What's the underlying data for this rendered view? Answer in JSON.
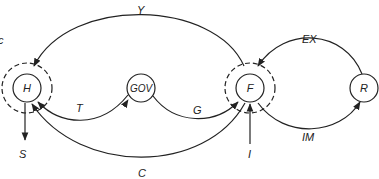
{
  "diagram": {
    "corner_label": "c",
    "nodes": [
      {
        "id": "H",
        "label": "H",
        "boundary": "dashed"
      },
      {
        "id": "GOV",
        "label": "GOV",
        "boundary": "none"
      },
      {
        "id": "F",
        "label": "F",
        "boundary": "dashed"
      },
      {
        "id": "R",
        "label": "R",
        "boundary": "none"
      }
    ],
    "edges": [
      {
        "from": "F",
        "to": "H",
        "label": "Y"
      },
      {
        "from": "GOV",
        "to": "H",
        "label": "T"
      },
      {
        "from": "GOV",
        "to": "F",
        "label": "G"
      },
      {
        "from": "F",
        "to": "H",
        "label": "C"
      },
      {
        "from": "R",
        "to": "F",
        "label": "EX"
      },
      {
        "from": "F",
        "to": "R",
        "label": "IM"
      },
      {
        "from": "H",
        "to": "out",
        "label": "S"
      },
      {
        "from": "in",
        "to": "F",
        "label": "I"
      }
    ],
    "labels": {
      "Y": "Y",
      "T": "T",
      "G": "G",
      "C": "C",
      "EX": "EX",
      "IM": "IM",
      "S": "S",
      "I": "I"
    },
    "colors": {
      "stroke": "#222222",
      "background": "#ffffff"
    }
  }
}
